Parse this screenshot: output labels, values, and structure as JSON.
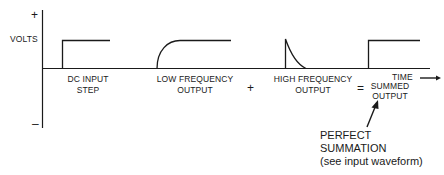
{
  "axis": {
    "plus_label": "+",
    "minus_label": "–",
    "y_label": "VOLTS",
    "x_label": "TIME"
  },
  "waveforms": [
    {
      "id": "dc-input-step",
      "label_line1": "DC INPUT",
      "label_line2": "STEP",
      "shape": "step"
    },
    {
      "id": "low-frequency-output",
      "label_line1": "LOW FREQUENCY",
      "label_line2": "OUTPUT",
      "shape": "rising-exponential"
    },
    {
      "id": "high-frequency-output",
      "label_line1": "HIGH FREQUENCY",
      "label_line2": "OUTPUT",
      "shape": "decaying-spike"
    },
    {
      "id": "summed-output",
      "label_line1": "SUMMED",
      "label_line2": "OUTPUT",
      "shape": "step"
    }
  ],
  "operators": {
    "plus": "+",
    "equals": "="
  },
  "annotation": {
    "line1": "PERFECT",
    "line2": "SUMMATION",
    "line3": "(see input waveform)"
  },
  "colors": {
    "line": "#1a1a1a",
    "background": "#ffffff"
  }
}
